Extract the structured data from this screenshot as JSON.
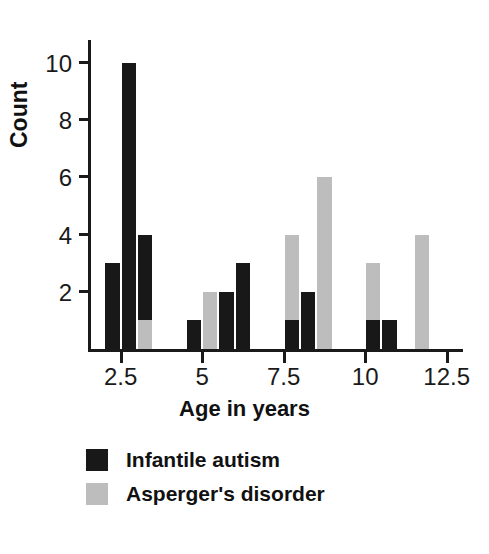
{
  "chart_data": {
    "type": "bar",
    "title": "",
    "xlabel": "Age in years",
    "ylabel": "Count",
    "xlim": [
      1.5,
      13.0
    ],
    "ylim": [
      0,
      10.8
    ],
    "bin_width": 0.5,
    "grid": false,
    "legend_position": "below-axes-left",
    "xticks": [
      "2.5",
      "5",
      "7.5",
      "10",
      "12.5"
    ],
    "xtick_values": [
      2.5,
      5,
      7.5,
      10,
      12.5
    ],
    "yticks": [
      "2",
      "4",
      "6",
      "8",
      "10"
    ],
    "ytick_values": [
      2,
      4,
      6,
      8,
      10
    ],
    "series": [
      {
        "name": "Infantile autism",
        "color": "#181818",
        "bins": [
          {
            "x": 2.0,
            "value": 3
          },
          {
            "x": 2.5,
            "value": 10
          },
          {
            "x": 3.0,
            "value": 4
          },
          {
            "x": 4.5,
            "value": 1
          },
          {
            "x": 5.5,
            "value": 2
          },
          {
            "x": 6.0,
            "value": 3
          },
          {
            "x": 7.5,
            "value": 1
          },
          {
            "x": 8.0,
            "value": 2
          },
          {
            "x": 10.0,
            "value": 1
          },
          {
            "x": 10.5,
            "value": 1
          }
        ]
      },
      {
        "name": "Asperger's disorder",
        "color": "#bdbdbd",
        "bins": [
          {
            "x": 3.0,
            "value": 1
          },
          {
            "x": 5.0,
            "value": 2
          },
          {
            "x": 7.5,
            "value": 4
          },
          {
            "x": 8.5,
            "value": 6
          },
          {
            "x": 10.0,
            "value": 3
          },
          {
            "x": 11.5,
            "value": 4
          }
        ]
      }
    ],
    "bars": [
      {
        "x": 2.0,
        "value": 3,
        "group": "dark"
      },
      {
        "x": 2.5,
        "value": 10,
        "group": "dark"
      },
      {
        "x": 3.0,
        "value": 4,
        "group": "dark"
      },
      {
        "x": 3.0,
        "value": 1,
        "group": "light"
      },
      {
        "x": 4.5,
        "value": 1,
        "group": "dark"
      },
      {
        "x": 5.0,
        "value": 2,
        "group": "light"
      },
      {
        "x": 5.5,
        "value": 2,
        "group": "dark"
      },
      {
        "x": 6.0,
        "value": 3,
        "group": "dark"
      },
      {
        "x": 7.5,
        "value": 4,
        "group": "light"
      },
      {
        "x": 7.5,
        "value": 1,
        "group": "dark"
      },
      {
        "x": 8.0,
        "value": 2,
        "group": "dark"
      },
      {
        "x": 8.5,
        "value": 6,
        "group": "light"
      },
      {
        "x": 10.0,
        "value": 3,
        "group": "light"
      },
      {
        "x": 10.0,
        "value": 1,
        "group": "dark"
      },
      {
        "x": 10.5,
        "value": 1,
        "group": "dark"
      },
      {
        "x": 11.5,
        "value": 4,
        "group": "light"
      }
    ]
  },
  "legend": {
    "items": [
      {
        "label": "Infantile autism",
        "swatch": "dark"
      },
      {
        "label": "Asperger's disorder",
        "swatch": "light"
      }
    ]
  },
  "axis": {
    "ylabel": "Count",
    "xlabel": "Age in years"
  },
  "colors": {
    "dark_series": "#181818",
    "light_series": "#bdbdbd",
    "axis": "#1a1a1a",
    "background": "#ffffff"
  }
}
